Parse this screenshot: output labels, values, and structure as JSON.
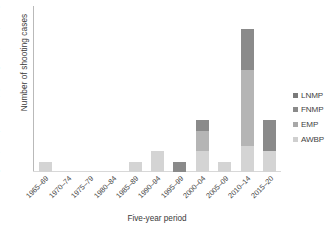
{
  "chart_data": {
    "type": "bar",
    "stacked": true,
    "title": "",
    "xlabel": "Five-year period",
    "ylabel": "Number of shooting cases",
    "ylim": [
      0,
      16
    ],
    "yticks": [
      0,
      2,
      4,
      7,
      8,
      10,
      12,
      14,
      16
    ],
    "ytick_labels": [
      "0",
      "2",
      "4",
      "7",
      "8",
      "10",
      "12",
      "14",
      "16"
    ],
    "grid": false,
    "legend_position": "right",
    "categories": [
      "1965–69",
      "1970–74",
      "1975–79",
      "1980–84",
      "1985–89",
      "1990–94",
      "1995–99",
      "2000–04",
      "2005–09",
      "2010–14",
      "2015–20"
    ],
    "series": [
      {
        "name": "AWBP",
        "color": "#d4d4d4",
        "values": [
          1,
          0,
          0,
          0,
          1,
          2,
          0,
          2,
          1,
          2.5,
          2
        ]
      },
      {
        "name": "EMP",
        "color": "#b5b5b5",
        "values": [
          0,
          0,
          0,
          0,
          0,
          0,
          0,
          2,
          0,
          7.4,
          0
        ]
      },
      {
        "name": "FNMP",
        "color": "#8a8a8a",
        "values": [
          0,
          0,
          0,
          0,
          0,
          0,
          1,
          1,
          0,
          4,
          3
        ]
      },
      {
        "name": "LNMP",
        "color": "#6e6e6e",
        "values": [
          0,
          0,
          0,
          0,
          0,
          0,
          0,
          0,
          0,
          0,
          0
        ]
      }
    ],
    "legend_entries": [
      {
        "label": "LNMP",
        "color": "#7a7a7a"
      },
      {
        "label": "FNMP",
        "color": "#8a8a8a"
      },
      {
        "label": "EMP",
        "color": "#a8a8a8"
      },
      {
        "label": "AWBP",
        "color": "#cfcfcf"
      }
    ],
    "totals": [
      1,
      0,
      0,
      0,
      1,
      2,
      1,
      5,
      1,
      13.9,
      5
    ]
  },
  "axis_colors": {
    "axis_line": "#b9b9b9",
    "text": "#3f3f3f",
    "background": "#ffffff"
  }
}
